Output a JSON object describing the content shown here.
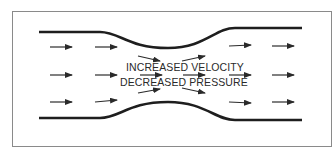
{
  "diagram": {
    "type": "venturi-flow",
    "labels": {
      "velocity": "INCREASED VELOCITY",
      "pressure": "DECREASED PRESSURE"
    },
    "colors": {
      "frame": "#8a8a8a",
      "wall": "#1e1e1e",
      "arrow": "#2a2a2a",
      "background": "#ffffff"
    },
    "flow_direction": "left-to-right",
    "arrow_rows": 3,
    "arrow_columns": 6
  }
}
